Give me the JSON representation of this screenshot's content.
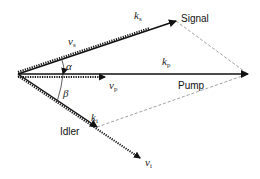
{
  "diagram": {
    "labels": {
      "signal": "Signal",
      "pump": "Pump",
      "idler": "Idler",
      "nu_s": {
        "base": "ν",
        "sub": "s"
      },
      "k_s": {
        "base": "k",
        "sub": "s"
      },
      "k_p": {
        "base": "k",
        "sub": "p"
      },
      "nu_p": {
        "base": "ν",
        "sub": "p"
      },
      "k_i": {
        "base": "k",
        "sub": "i"
      },
      "nu_i": {
        "base": "ν",
        "sub": "i"
      },
      "alpha": "α",
      "beta": "β"
    },
    "geometry": {
      "origin": [
        18,
        74
      ],
      "signal_tip": [
        176,
        21
      ],
      "pump_tip": [
        248,
        74
      ],
      "idler_tip": [
        97,
        127
      ],
      "nu_p_tip": [
        105,
        74
      ],
      "nu_i_tip": [
        140,
        158
      ]
    },
    "colors": {
      "arrow": "#111111",
      "dashed": "#888888"
    }
  }
}
